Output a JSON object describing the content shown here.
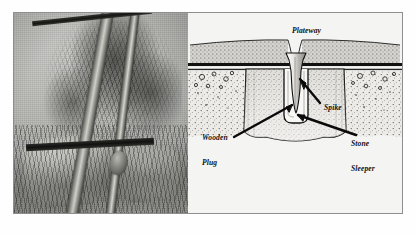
{
  "figure": {
    "panel_background": "#b4b4b4",
    "panel_border": "#8e8e8e",
    "page_background": "#ffffff"
  },
  "photo": {
    "name": "plateway-stone-sleeper-photograph",
    "description": "Halftone photograph of a plateway rail laid diagonally across a stone sleeper block set among grass and rubble",
    "tone": "black-and-white halftone"
  },
  "diagram": {
    "name": "stone-sleeper-cross-section",
    "ink_color": "#111111",
    "paper_color": "#f4f4f2",
    "labels": [
      {
        "id": "plateway",
        "text": "Plateway",
        "line1": "Plateway",
        "line2": ""
      },
      {
        "id": "spike",
        "text": "Spike",
        "line1": "Spike",
        "line2": ""
      },
      {
        "id": "wooden-plug",
        "text": "Wooden Plug",
        "line1": "Wooden",
        "line2": "Plug"
      },
      {
        "id": "stone-sleeper",
        "text": "Stone Sleeper",
        "line1": "Stone",
        "line2": "Sleeper"
      }
    ],
    "parts": [
      "plateway rail",
      "spike",
      "wooden plug",
      "stone sleeper",
      "ballast"
    ]
  }
}
